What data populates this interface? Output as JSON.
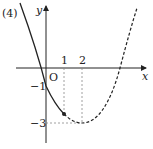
{
  "problem_label": "(4)",
  "axes": {
    "x_label": "x",
    "y_label": "y",
    "origin_label": "O"
  },
  "ticks": {
    "x": [
      "1",
      "2"
    ],
    "y": [
      "−1",
      "−3"
    ]
  },
  "curve": {
    "type": "parabola",
    "vertex": [
      2,
      -3
    ],
    "y_intercept": -1,
    "marked_point_x": 1,
    "solid_until_x": 1,
    "dashed_after_x": 1
  },
  "colors": {
    "ink": "#222222",
    "guide": "#888888"
  }
}
